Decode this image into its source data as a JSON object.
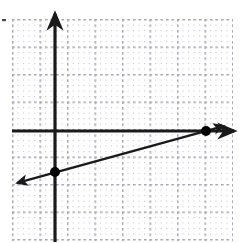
{
  "figure": {
    "name": "coordinate-plane-linear-graph",
    "width": 241,
    "height": 243,
    "background_color": "#ffffff",
    "caption": ""
  },
  "colors": {
    "axis": "#1a1a1a",
    "line": "#1a1a1a",
    "point": "#000000",
    "grid_minor": "#c9c9cf",
    "grid_major": "#a9a9b4",
    "background": "#ffffff"
  },
  "grid": {
    "type": "dotted",
    "minor_spacing_px": 5.5,
    "major_spacing_px": 27.5,
    "minor_per_major": 5,
    "left_px": 12,
    "top_px": 19,
    "right_px": 233,
    "bottom_px": 241,
    "show_labels": false,
    "show_tick_numbers": false
  },
  "axes": {
    "origin_px": {
      "x": 55,
      "y": 131
    },
    "unit_px": 27.5,
    "x_axis": {
      "label": "",
      "start_px": {
        "x": 12,
        "y": 131
      },
      "end_px": {
        "x": 238,
        "y": 131
      },
      "arrow_right": true,
      "arrow_left": false,
      "range_units": [
        -1.6,
        6.7
      ]
    },
    "y_axis": {
      "label": "",
      "start_px": {
        "x": 55,
        "y": 242
      },
      "end_px": {
        "x": 55,
        "y": 10
      },
      "arrow_up": true,
      "arrow_down": false,
      "range_units": [
        -4.0,
        4.4
      ]
    }
  },
  "chart_data": {
    "type": "line",
    "title": "",
    "subtitle": "",
    "xlabel": "",
    "ylabel": "",
    "xlim": [
      -1.6,
      6.7
    ],
    "ylim": [
      -4.0,
      4.4
    ],
    "grid": true,
    "legend": null,
    "legend_position": "none",
    "series": [
      {
        "name": "line",
        "kind": "linear-function",
        "slope": 0.27,
        "y_intercept": -1.5,
        "x_intercept": 5.5,
        "equation": "y = 0.27x - 1.5",
        "arrow_start": true,
        "arrow_end": true,
        "x": [
          -1.55,
          6.3
        ],
        "y": [
          -1.92,
          0.21
        ],
        "endpoints_px": [
          {
            "x": 13,
            "y": 184
          },
          {
            "x": 228,
            "y": 125
          }
        ]
      }
    ],
    "points": [
      {
        "label": "",
        "name": "y-intercept-point",
        "x": 0,
        "y": -1.5,
        "px": {
          "x": 55,
          "y": 172
        },
        "marker": "filled-circle",
        "radius_px": 5
      },
      {
        "label": "",
        "name": "x-intercept-point",
        "x": 5.5,
        "y": 0,
        "px": {
          "x": 206,
          "y": 131
        },
        "marker": "filled-circle",
        "radius_px": 5
      }
    ],
    "annotations": [
      {
        "name": "corner-tick-mark",
        "text": "",
        "px": {
          "x": 3,
          "y": 20
        }
      }
    ]
  }
}
